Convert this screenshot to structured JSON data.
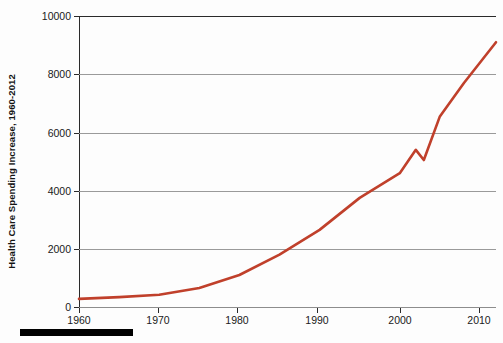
{
  "figure": {
    "background_color": "#fdfdfd",
    "line_color": "#c0402b",
    "axis_color": "#2a2a2a",
    "grid_color": "#9a9a9a"
  },
  "axes": {
    "y_axis_title": "Health Care Spending Increase, 1960-2012",
    "y_ticks": [
      "0",
      "2000",
      "4000",
      "6000",
      "8000",
      "10000"
    ],
    "x_ticks": [
      "1960",
      "1970",
      "1980",
      "1990",
      "2000",
      "2010"
    ]
  },
  "footer": {
    "rule_name": "black-rule"
  },
  "chart_data": {
    "type": "line",
    "title": "",
    "subtitle": "",
    "xlabel": "",
    "ylabel": "Health Care Spending Increase, 1960-2012",
    "xlim": [
      1960,
      2012
    ],
    "ylim": [
      0,
      10000
    ],
    "grid": true,
    "legend": null,
    "x_tick_values": [
      1960,
      1970,
      1980,
      1990,
      2000,
      2010
    ],
    "y_tick_values": [
      0,
      2000,
      4000,
      6000,
      8000,
      10000
    ],
    "series": [
      {
        "name": "Health care spending per capita",
        "color": "#c0402b",
        "x": [
          1960,
          1965,
          1970,
          1975,
          1980,
          1985,
          1990,
          1995,
          2000,
          2002,
          2003,
          2005,
          2008,
          2012
        ],
        "values": [
          280,
          340,
          420,
          650,
          1100,
          1800,
          2650,
          3750,
          4600,
          5400,
          5050,
          6550,
          7700,
          9100
        ]
      }
    ],
    "annotations": []
  }
}
